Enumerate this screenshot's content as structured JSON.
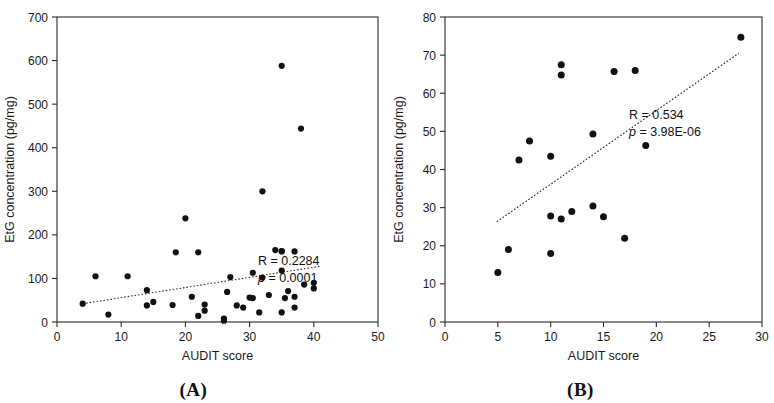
{
  "figure": {
    "panels": [
      {
        "caption": "(A)",
        "xlabel": "AUDIT score",
        "ylabel": "EtG concentration (pg/mg)",
        "r_label": "R = 0.2284",
        "p_label": "p = 0.0001"
      },
      {
        "caption": "(B)",
        "xlabel": "AUDIT score",
        "ylabel": "EtG concentration (pg/mg)",
        "r_label": "R = 0.534",
        "p_label": "p = 3.98E-06"
      }
    ]
  },
  "chart_data": [
    {
      "type": "scatter",
      "title": "(A)",
      "xlabel": "AUDIT score",
      "ylabel": "EtG concentration (pg/mg)",
      "xlim": [
        0,
        50
      ],
      "ylim": [
        0,
        700
      ],
      "xticks": [
        0,
        10,
        20,
        30,
        40,
        50
      ],
      "yticks": [
        0,
        100,
        200,
        300,
        400,
        500,
        600,
        700
      ],
      "grid": false,
      "legend": null,
      "annotations": [
        "R = 0.2284",
        "p = 0.0001"
      ],
      "correlation_r": 0.2284,
      "p_value": 0.0001,
      "trendline": {
        "style": "dotted",
        "x_start": 4,
        "y_start": 42,
        "x_end": 41,
        "y_end": 128
      },
      "points": [
        {
          "x": 4,
          "y": 42
        },
        {
          "x": 6,
          "y": 105
        },
        {
          "x": 8,
          "y": 17
        },
        {
          "x": 11,
          "y": 105
        },
        {
          "x": 14,
          "y": 73
        },
        {
          "x": 14,
          "y": 38
        },
        {
          "x": 15,
          "y": 46
        },
        {
          "x": 18,
          "y": 39
        },
        {
          "x": 18.5,
          "y": 160
        },
        {
          "x": 20,
          "y": 238
        },
        {
          "x": 21,
          "y": 58
        },
        {
          "x": 22,
          "y": 160
        },
        {
          "x": 22,
          "y": 14
        },
        {
          "x": 23,
          "y": 40
        },
        {
          "x": 23,
          "y": 26
        },
        {
          "x": 26,
          "y": 8
        },
        {
          "x": 26,
          "y": 3
        },
        {
          "x": 26.5,
          "y": 69
        },
        {
          "x": 27,
          "y": 103
        },
        {
          "x": 28,
          "y": 38
        },
        {
          "x": 29,
          "y": 33
        },
        {
          "x": 30,
          "y": 56
        },
        {
          "x": 30.5,
          "y": 55
        },
        {
          "x": 30.5,
          "y": 113
        },
        {
          "x": 31.5,
          "y": 22
        },
        {
          "x": 32,
          "y": 300
        },
        {
          "x": 32,
          "y": 102
        },
        {
          "x": 33,
          "y": 62
        },
        {
          "x": 34,
          "y": 165
        },
        {
          "x": 35,
          "y": 588
        },
        {
          "x": 35,
          "y": 163
        },
        {
          "x": 35,
          "y": 162
        },
        {
          "x": 35,
          "y": 118
        },
        {
          "x": 35,
          "y": 22
        },
        {
          "x": 35.5,
          "y": 55
        },
        {
          "x": 36,
          "y": 71
        },
        {
          "x": 37,
          "y": 162
        },
        {
          "x": 37,
          "y": 58
        },
        {
          "x": 37,
          "y": 33
        },
        {
          "x": 38,
          "y": 444
        },
        {
          "x": 38.5,
          "y": 86
        },
        {
          "x": 40,
          "y": 90
        },
        {
          "x": 40,
          "y": 77
        }
      ]
    },
    {
      "type": "scatter",
      "title": "(B)",
      "xlabel": "AUDIT score",
      "ylabel": "EtG concentration (pg/mg)",
      "xlim": [
        0,
        30
      ],
      "ylim": [
        0,
        80
      ],
      "xticks": [
        0,
        5,
        10,
        15,
        20,
        25,
        30
      ],
      "yticks": [
        0,
        10,
        20,
        30,
        40,
        50,
        60,
        70,
        80
      ],
      "grid": false,
      "legend": null,
      "annotations": [
        "R = 0.534",
        "p = 3.98E-06"
      ],
      "correlation_r": 0.534,
      "p_value": 3.98e-06,
      "trendline": {
        "style": "dotted",
        "x_start": 4.9,
        "y_start": 26.3,
        "x_end": 27.8,
        "y_end": 70.5
      },
      "points": [
        {
          "x": 5,
          "y": 13
        },
        {
          "x": 6,
          "y": 19
        },
        {
          "x": 7,
          "y": 42.5
        },
        {
          "x": 8,
          "y": 47.5
        },
        {
          "x": 10,
          "y": 43.5
        },
        {
          "x": 10,
          "y": 27.8
        },
        {
          "x": 10,
          "y": 18
        },
        {
          "x": 11,
          "y": 67.5
        },
        {
          "x": 11,
          "y": 64.8
        },
        {
          "x": 11,
          "y": 27
        },
        {
          "x": 12,
          "y": 29
        },
        {
          "x": 14,
          "y": 49.3
        },
        {
          "x": 14,
          "y": 30.4
        },
        {
          "x": 15,
          "y": 27.6
        },
        {
          "x": 16,
          "y": 65.7
        },
        {
          "x": 17,
          "y": 22
        },
        {
          "x": 18,
          "y": 66
        },
        {
          "x": 19,
          "y": 46.3
        },
        {
          "x": 28,
          "y": 74.7
        }
      ]
    }
  ]
}
